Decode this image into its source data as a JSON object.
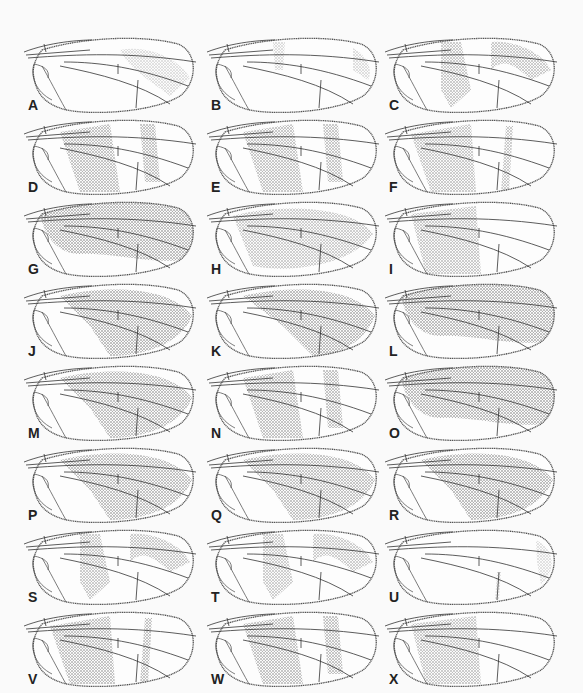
{
  "figure": {
    "type": "plate of insect wing illustrations",
    "panels": [
      {
        "label": "A",
        "pattern": "faint",
        "density": 0.12
      },
      {
        "label": "B",
        "pattern": "faint-bands",
        "density": 0.15
      },
      {
        "label": "C",
        "pattern": "sinuous-bands",
        "density": 0.45
      },
      {
        "label": "D",
        "pattern": "banded",
        "density": 0.55
      },
      {
        "label": "E",
        "pattern": "banded",
        "density": 0.5
      },
      {
        "label": "F",
        "pattern": "banded-basal",
        "density": 0.45
      },
      {
        "label": "G",
        "pattern": "dark-diffuse",
        "density": 0.65
      },
      {
        "label": "H",
        "pattern": "mottled",
        "density": 0.4
      },
      {
        "label": "I",
        "pattern": "basal-dark",
        "density": 0.45
      },
      {
        "label": "J",
        "pattern": "dark-spotted",
        "density": 0.65
      },
      {
        "label": "K",
        "pattern": "dark-banded",
        "density": 0.65
      },
      {
        "label": "L",
        "pattern": "dark-diffuse",
        "density": 0.75
      },
      {
        "label": "M",
        "pattern": "dark-spotted",
        "density": 0.6
      },
      {
        "label": "N",
        "pattern": "banded",
        "density": 0.55
      },
      {
        "label": "O",
        "pattern": "dark-diffuse",
        "density": 0.75
      },
      {
        "label": "P",
        "pattern": "dark-spotted",
        "density": 0.6
      },
      {
        "label": "Q",
        "pattern": "dark-spotted",
        "density": 0.55
      },
      {
        "label": "R",
        "pattern": "dark-spotted",
        "density": 0.65
      },
      {
        "label": "S",
        "pattern": "sinuous-bands",
        "density": 0.45
      },
      {
        "label": "T",
        "pattern": "sinuous-bands",
        "density": 0.4
      },
      {
        "label": "U",
        "pattern": "clear-apical",
        "density": 0.1
      },
      {
        "label": "V",
        "pattern": "banded-basal",
        "density": 0.55
      },
      {
        "label": "W",
        "pattern": "banded",
        "density": 0.55
      },
      {
        "label": "X",
        "pattern": "basal-dark",
        "density": 0.45
      }
    ],
    "colors": {
      "ink": "#3a3a3a",
      "shade": "#6f6f6f",
      "paper": "#fafafa"
    }
  }
}
